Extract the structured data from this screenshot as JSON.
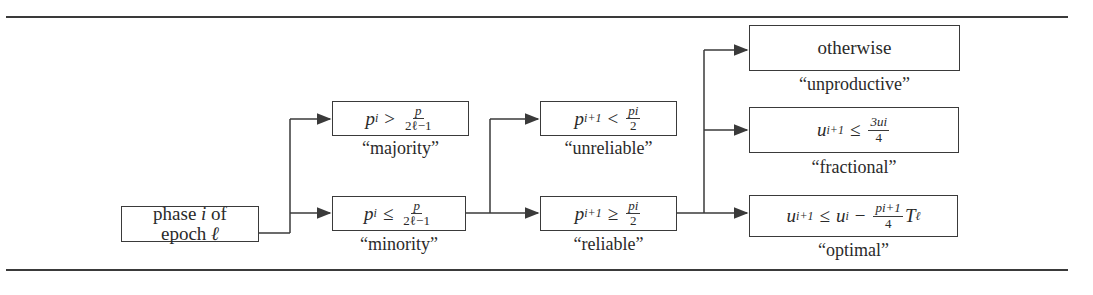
{
  "diagram": {
    "start": {
      "line1": "phase",
      "var_i": "i",
      "of": "of",
      "line2": "epoch",
      "var_l": "ℓ"
    },
    "stage1": [
      {
        "id": "majority",
        "lhs": "p",
        "lhs_sub": "i",
        "op": ">",
        "num": "p",
        "den": "2ℓ−1",
        "label": "“majority”"
      },
      {
        "id": "minority",
        "lhs": "p",
        "lhs_sub": "i",
        "op": "≤",
        "num": "p",
        "den": "2ℓ−1",
        "label": "“minority”"
      }
    ],
    "stage2": [
      {
        "id": "unreliable",
        "lhs": "p",
        "lhs_sub": "i+1",
        "op": "<",
        "num": "pi",
        "den": "2",
        "label": "“unreliable”"
      },
      {
        "id": "reliable",
        "lhs": "p",
        "lhs_sub": "i+1",
        "op": "≥",
        "num": "pi",
        "den": "2",
        "label": "“reliable”"
      }
    ],
    "stage3": [
      {
        "id": "unproductive",
        "text": "otherwise",
        "label": "“unproductive”"
      },
      {
        "id": "fractional",
        "lhs": "u",
        "lhs_sub": "i+1",
        "op": "≤",
        "num": "3ui",
        "den": "4",
        "label": "“fractional”"
      },
      {
        "id": "optimal",
        "lhs": "u",
        "lhs_sub": "i+1",
        "op": "≤",
        "rhs_var": "u",
        "rhs_sub": "i",
        "minus": "−",
        "num": "pi+1",
        "den": "4",
        "tail": "T",
        "tail_sub": "ℓ",
        "label": "“optimal”"
      }
    ],
    "colors": {
      "line": "#3a3a3a",
      "text": "#2a2a2a",
      "background": "#ffffff"
    }
  }
}
